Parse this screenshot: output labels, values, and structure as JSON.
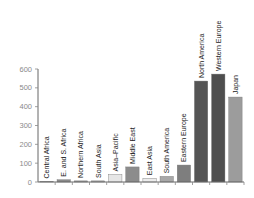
{
  "chart_data": {
    "type": "bar",
    "title": "",
    "xlabel": "",
    "ylabel": "",
    "ylim": [
      0,
      600
    ],
    "yticks": [
      0,
      100,
      200,
      300,
      400,
      500,
      600
    ],
    "grid": false,
    "legend": null,
    "categories": [
      "Central Africa",
      "E. and S. Africa",
      "Northern Africa",
      "South Asia",
      "Asia–Pacific",
      "Middle East",
      "East Asia",
      "South America",
      "Eastern Europe",
      "North America",
      "Western Europe",
      "Japan"
    ],
    "values": [
      3,
      12,
      6,
      6,
      40,
      80,
      20,
      30,
      90,
      536,
      573,
      451
    ],
    "colors": [
      "#707070",
      "#8a8a8a",
      "#9a9a9a",
      "#a8a8a8",
      "#e6e6e6",
      "#8c8c8c",
      "#ececec",
      "#a8a8a8",
      "#7e7e7e",
      "#555555",
      "#4e4e4e",
      "#9c9c9c"
    ]
  }
}
